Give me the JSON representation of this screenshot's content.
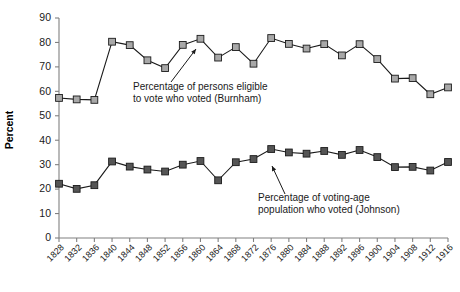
{
  "chart_data": {
    "type": "line",
    "title": "",
    "subtitle": "",
    "xlabel": "",
    "ylabel": "Percent",
    "ylim": [
      0,
      90
    ],
    "ytick_step": 10,
    "grid": false,
    "legend_position": "inline-annotations",
    "categories": [
      "1828",
      "1832",
      "1836",
      "1840",
      "1844",
      "1848",
      "1852",
      "1856",
      "1860",
      "1864",
      "1868",
      "1872",
      "1876",
      "1880",
      "1884",
      "1888",
      "1892",
      "1896",
      "1900",
      "1904",
      "1908",
      "1912",
      "1916"
    ],
    "yticks": [
      "0",
      "10",
      "20",
      "30",
      "40",
      "50",
      "60",
      "70",
      "80",
      "90"
    ],
    "series": [
      {
        "name": "Percentage of persons eligible to vote who voted (Burnham)",
        "marker_color": "#a8a8a8",
        "line_color": "#1a1a1a",
        "values": [
          57.3,
          56.7,
          56.5,
          80.3,
          78.9,
          72.7,
          69.5,
          79.0,
          81.5,
          73.8,
          78.1,
          71.3,
          81.8,
          79.4,
          77.5,
          79.3,
          74.7,
          79.3,
          73.2,
          65.2,
          65.4,
          58.8,
          61.6
        ]
      },
      {
        "name": "Percentage of voting-age population who voted (Johnson)",
        "marker_color": "#555555",
        "line_color": "#1a1a1a",
        "values": [
          22.2,
          20.1,
          21.6,
          31.3,
          29.2,
          28.0,
          27.2,
          30.0,
          31.5,
          23.6,
          31.0,
          32.3,
          36.4,
          35.0,
          34.5,
          35.6,
          34.0,
          36.0,
          33.1,
          29.0,
          29.1,
          27.6,
          31.1
        ]
      }
    ],
    "annotations": [
      {
        "id": "burnham-annotation",
        "lines": [
          "Percentage of persons eligible",
          "to vote who voted (Burnham)"
        ],
        "text_x": 133,
        "text_y": 90,
        "arrow": {
          "x1": 171,
          "y1": 82,
          "x2": 196,
          "y2": 49
        }
      },
      {
        "id": "johnson-annotation",
        "lines": [
          "Percentage of voting-age",
          "population who voted (Johnson)"
        ],
        "text_x": 258,
        "text_y": 201,
        "arrow": {
          "x1": 285,
          "y1": 194,
          "x2": 272,
          "y2": 166
        }
      }
    ]
  }
}
